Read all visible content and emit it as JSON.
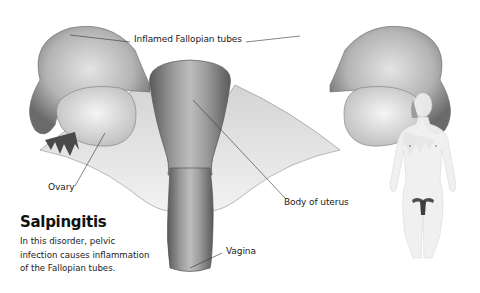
{
  "figure": {
    "title": "Salpingitis",
    "description": "In this disorder, pelvic infection causes inflammation of the Fallopian tubes.",
    "labels": {
      "fallopian_tubes": "Inflamed Fallopian tubes",
      "ovary": "Ovary",
      "body_of_uterus": "Body of uterus",
      "vagina": "Vagina"
    },
    "colors": {
      "tissue_dark": "#5a5a5a",
      "tissue_mid": "#9a9a9a",
      "tissue_light": "#e6e6e6",
      "leader_line": "#333333"
    }
  }
}
